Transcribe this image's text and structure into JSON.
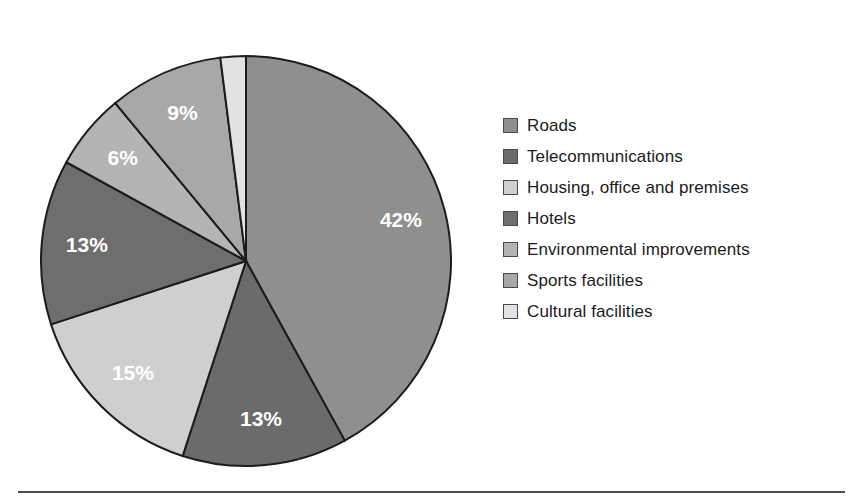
{
  "figure": {
    "background_color": "#ffffff",
    "bottom_rule_color": "#4f4f4f"
  },
  "chart_data": {
    "type": "pie",
    "title": "",
    "subtitle": "",
    "xlabel": "",
    "ylabel": "",
    "grid": false,
    "legend_position": "right",
    "start_angle_deg": 0,
    "direction": "clockwise",
    "units": "percent",
    "total": 100,
    "categories": [
      "Roads",
      "Telecommunications",
      "Housing, office and premises",
      "Hotels",
      "Environmental improvements",
      "Sports facilities",
      "Cultural facilities"
    ],
    "values": [
      42,
      13,
      15,
      13,
      6,
      9,
      2
    ],
    "data_labels": [
      "42%",
      "13%",
      "15%",
      "13%",
      "6%",
      "9%",
      "2%"
    ],
    "colors": [
      "#8f8f8f",
      "#6b6b6b",
      "#cfcfcf",
      "#6e6e6e",
      "#b4b4b4",
      "#a8a8a8",
      "#e2e2e2"
    ],
    "slices": [
      {
        "label": "Roads",
        "value": 42,
        "data_label": "42%",
        "color": "#8f8f8f",
        "label_color": "#ffffff",
        "label_placement": "inside"
      },
      {
        "label": "Telecommunications",
        "value": 13,
        "data_label": "13%",
        "color": "#6b6b6b",
        "label_color": "#ffffff",
        "label_placement": "inside"
      },
      {
        "label": "Housing, office and premises",
        "value": 15,
        "data_label": "15%",
        "color": "#cfcfcf",
        "label_color": "#ffffff",
        "label_placement": "inside"
      },
      {
        "label": "Hotels",
        "value": 13,
        "data_label": "13%",
        "color": "#6e6e6e",
        "label_color": "#ffffff",
        "label_placement": "inside"
      },
      {
        "label": "Environmental improvements",
        "value": 6,
        "data_label": "6%",
        "color": "#b4b4b4",
        "label_color": "#ffffff",
        "label_placement": "inside"
      },
      {
        "label": "Sports facilities",
        "value": 9,
        "data_label": "9%",
        "color": "#a8a8a8",
        "label_color": "#ffffff",
        "label_placement": "inside"
      },
      {
        "label": "Cultural facilities",
        "value": 2,
        "data_label": "2%",
        "color": "#e2e2e2",
        "label_color": "#111111",
        "label_placement": "outside"
      }
    ]
  },
  "legend": {
    "items": [
      {
        "label": "Roads",
        "color": "#8f8f8f"
      },
      {
        "label": "Telecommunications",
        "color": "#6b6b6b"
      },
      {
        "label": "Housing, office and premises",
        "color": "#cfcfcf"
      },
      {
        "label": "Hotels",
        "color": "#6e6e6e"
      },
      {
        "label": "Environmental improvements",
        "color": "#b4b4b4"
      },
      {
        "label": "Sports facilities",
        "color": "#a8a8a8"
      },
      {
        "label": "Cultural facilities",
        "color": "#e2e2e2"
      }
    ]
  }
}
